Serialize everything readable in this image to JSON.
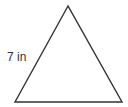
{
  "diagram": {
    "shape": "triangle",
    "type": "equilateral",
    "side_label": "7 in",
    "stroke_color": "#333333",
    "vertices": {
      "apex": [
        68,
        6
      ],
      "bottom_left": [
        15,
        102
      ],
      "bottom_right": [
        122,
        102
      ]
    }
  }
}
